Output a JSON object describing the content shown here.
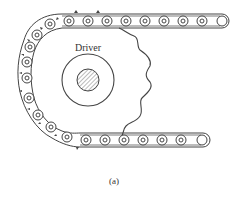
{
  "diagram": {
    "driver_label": "Driver",
    "caption": "(a)",
    "colors": {
      "line": "#444444",
      "background": "#ffffff",
      "hatch": "#777777"
    },
    "components": [
      "chain",
      "driver-sprocket",
      "hub",
      "shaft"
    ]
  }
}
